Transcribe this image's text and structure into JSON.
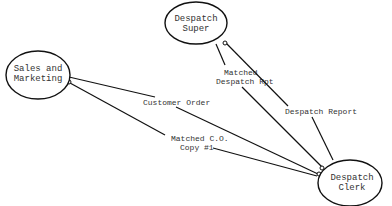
{
  "diagram": {
    "type": "data-flow",
    "nodes": [
      {
        "id": "sales",
        "lines": [
          "Sales and",
          "Marketing"
        ]
      },
      {
        "id": "super",
        "lines": [
          "Despatch",
          "Super"
        ]
      },
      {
        "id": "clerk",
        "lines": [
          "Despatch",
          "Clerk"
        ]
      }
    ],
    "edges": [
      {
        "id": "customer-order",
        "from": "sales",
        "to": "clerk",
        "label_lines": [
          "Customer Order"
        ]
      },
      {
        "id": "matched-co",
        "from": "clerk",
        "to": "sales",
        "label_lines": [
          "Matched C.O.",
          "Copy #1"
        ]
      },
      {
        "id": "matched-rpt",
        "from": "super",
        "to": "clerk",
        "label_lines": [
          "Matched",
          "Despatch Rpt"
        ]
      },
      {
        "id": "despatch-report",
        "from": "clerk",
        "to": "super",
        "label_lines": [
          "Despatch Report"
        ]
      }
    ]
  }
}
